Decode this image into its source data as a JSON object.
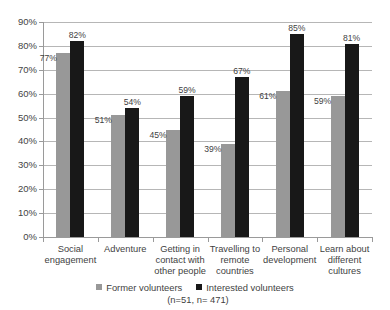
{
  "chart_data": {
    "type": "bar",
    "title": "",
    "subtitle": "",
    "xlabel": "",
    "ylabel": "",
    "ylim": [
      0,
      90
    ],
    "ytick_labels": [
      "0%",
      "10%",
      "20%",
      "30%",
      "40%",
      "50%",
      "60%",
      "70%",
      "80%",
      "90%"
    ],
    "ytick_values": [
      0,
      10,
      20,
      30,
      40,
      50,
      60,
      70,
      80,
      90
    ],
    "grid": true,
    "legend_position": "bottom",
    "categories": [
      "Social engagement",
      "Adventure",
      "Getting in contact with other people",
      "Travelling to remote countries",
      "Personal development",
      "Learn about different cultures"
    ],
    "category_lines": [
      [
        "Social",
        "engagement"
      ],
      [
        "Adventure"
      ],
      [
        "Getting in",
        "contact with",
        "other people"
      ],
      [
        "Travelling to",
        "remote",
        "countries"
      ],
      [
        "Personal",
        "development"
      ],
      [
        "Learn about",
        "different",
        "cultures"
      ]
    ],
    "series": [
      {
        "name": "Former volunteers",
        "color": "#989898",
        "values": [
          77,
          51,
          45,
          39,
          61,
          59
        ],
        "value_labels": [
          "77%",
          "51%",
          "45%",
          "39%",
          "61%",
          "59%"
        ]
      },
      {
        "name": "Interested volunteers",
        "color": "#181818",
        "values": [
          82,
          54,
          59,
          67,
          85,
          81
        ],
        "value_labels": [
          "82%",
          "54%",
          "59%",
          "67%",
          "85%",
          "81%"
        ]
      }
    ]
  },
  "legend": {
    "entries": [
      {
        "label": "Former volunteers",
        "swatch": "former"
      },
      {
        "label": "Interested volunteers",
        "swatch": "interested"
      }
    ],
    "note": "(n=51, n= 471)"
  }
}
